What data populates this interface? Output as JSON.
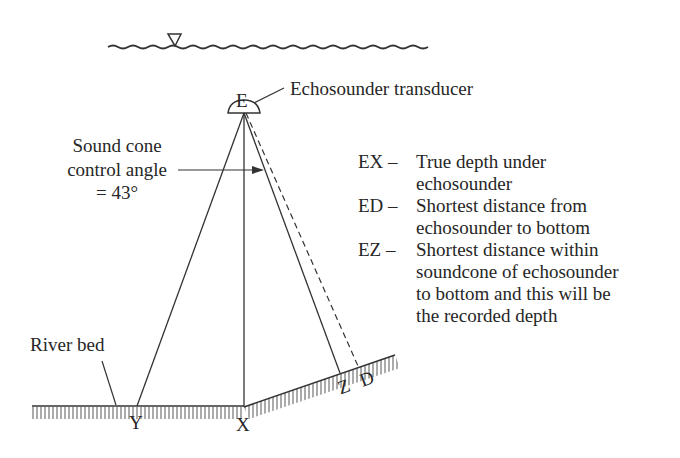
{
  "diagram": {
    "title_label": "Echosounder transducer",
    "points": {
      "E": "E",
      "X": "X",
      "Y": "Y",
      "Z": "Z",
      "D": "D"
    },
    "cone_label": {
      "line1": "Sound cone",
      "line2": "control angle",
      "line3": "= 43°"
    },
    "river_bed_label": "River bed",
    "water_surface_symbol": "▽",
    "legend": [
      {
        "key": "EX –",
        "desc": "True depth under\nechosounder"
      },
      {
        "key": "ED –",
        "desc": "Shortest distance from\nechosounder to bottom"
      },
      {
        "key": "EZ –",
        "desc": "Shortest distance within\nsoundcone of echosounder\nto bottom and this will be\nthe recorded depth"
      }
    ]
  }
}
